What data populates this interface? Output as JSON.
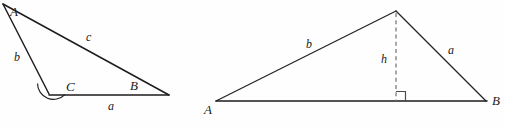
{
  "figure": {
    "background_color": "#fefefe",
    "stroke_color": "#1c1c1c",
    "dash_color": "#6f6f6f",
    "width": 505,
    "height": 127,
    "triangles": [
      {
        "id": "left-triangle",
        "description": "oblique triangle with labeled vertices A, B, C and sides a, b, c, angle arc at C",
        "vertices": [
          {
            "name": "A",
            "label": "A",
            "x": 3,
            "y": 4,
            "label_x": 10,
            "label_y": 16
          },
          {
            "name": "C",
            "label": "C",
            "x": 49,
            "y": 94,
            "label_x": 66,
            "label_y": 91
          },
          {
            "name": "B",
            "label": "B",
            "x": 169,
            "y": 95,
            "label_x": 130,
            "label_y": 90
          }
        ],
        "sides": [
          {
            "name": "a",
            "label": "a",
            "from": "C",
            "to": "B",
            "label_x": 108,
            "label_y": 110
          },
          {
            "name": "b",
            "label": "b",
            "from": "A",
            "to": "C",
            "label_x": 14,
            "label_y": 61
          },
          {
            "name": "c",
            "label": "c",
            "from": "A",
            "to": "B",
            "label_x": 86,
            "label_y": 41
          }
        ],
        "angle_marks": [
          {
            "at": "C",
            "type": "arc",
            "radius": 15
          }
        ]
      },
      {
        "id": "right-triangle",
        "description": "triangle ABC with dashed altitude h from apex to base AB and right angle marker",
        "vertices": [
          {
            "name": "A",
            "label": "A",
            "x": 216,
            "y": 101,
            "label_x": 204,
            "label_y": 114
          },
          {
            "name": "B",
            "label": "B",
            "x": 486,
            "y": 101,
            "label_x": 492,
            "label_y": 105
          },
          {
            "name": "apex",
            "label": "",
            "x": 396,
            "y": 11,
            "label_x": 0,
            "label_y": 0
          }
        ],
        "sides": [
          {
            "name": "b",
            "label": "b",
            "from": "A",
            "to": "apex",
            "label_x": 306,
            "label_y": 48
          },
          {
            "name": "a",
            "label": "a",
            "from": "apex",
            "to": "B",
            "label_x": 448,
            "label_y": 54
          },
          {
            "name": "base",
            "label": "",
            "from": "A",
            "to": "B",
            "label_x": 0,
            "label_y": 0
          }
        ],
        "altitude": {
          "name": "h",
          "label": "h",
          "from_x": 396,
          "from_y": 11,
          "to_x": 396,
          "to_y": 101,
          "label_x": 381,
          "label_y": 63,
          "style": "dashed"
        },
        "angle_marks": [
          {
            "at": "foot",
            "type": "right-angle-square",
            "size": 9
          }
        ]
      }
    ]
  }
}
